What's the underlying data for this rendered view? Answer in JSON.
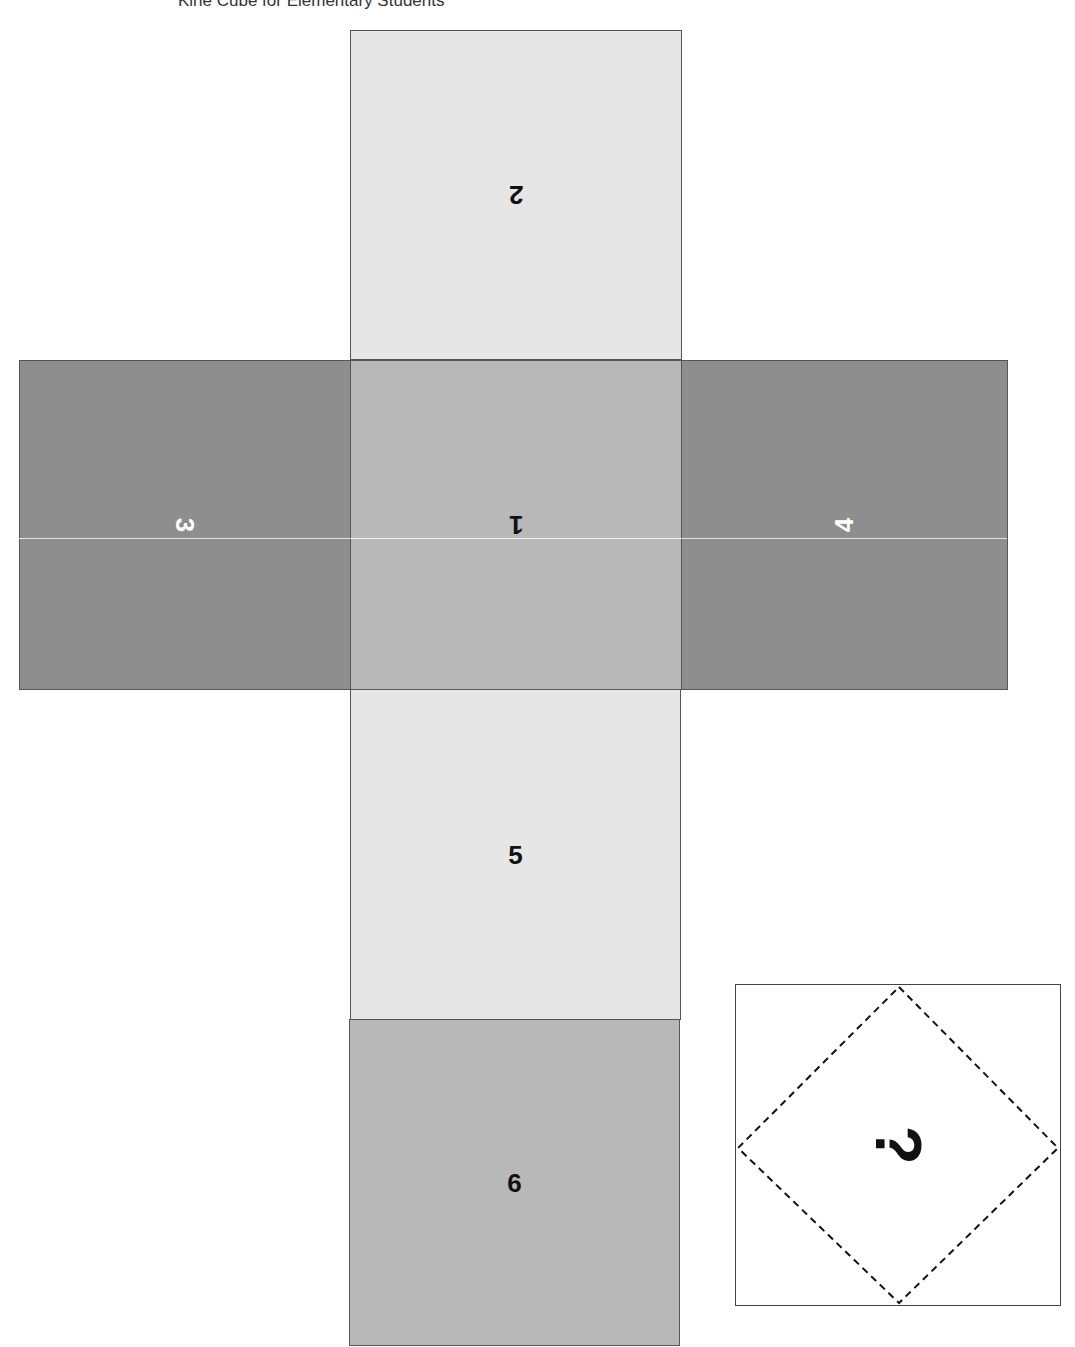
{
  "title": "Kirie Cube for Elementary Students",
  "colors": {
    "light": "#e6e6e6",
    "medium": "#b8b8b8",
    "dark": "#8e8e8e",
    "border": "#555555"
  },
  "net": {
    "faces": [
      {
        "id": "face-2",
        "label": "2",
        "rotation": 180,
        "shade": "light"
      },
      {
        "id": "face-3",
        "label": "3",
        "rotation": 90,
        "shade": "dark"
      },
      {
        "id": "face-1",
        "label": "1",
        "rotation": 180,
        "shade": "medium"
      },
      {
        "id": "face-4",
        "label": "4",
        "rotation": -90,
        "shade": "dark"
      },
      {
        "id": "face-5",
        "label": "5",
        "rotation": 0,
        "shade": "light"
      },
      {
        "id": "face-6",
        "label": "6",
        "rotation": 0,
        "shade": "medium"
      }
    ]
  },
  "mystery_box": {
    "label": "?",
    "rotation": 90,
    "border_style": "dashed diamond"
  }
}
